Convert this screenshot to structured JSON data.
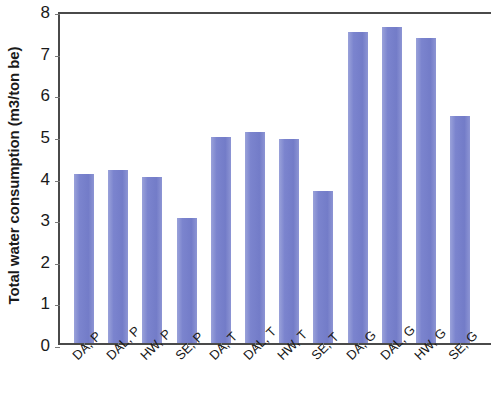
{
  "chart_data": {
    "type": "bar",
    "title": "",
    "subtitle": "",
    "xlabel": "",
    "ylabel": "Total water consumption (m3/ton be)",
    "ylim": [
      0,
      8
    ],
    "ytick_labels": [
      "8",
      "7",
      "6",
      "5",
      "4",
      "3",
      "2",
      "1",
      "0"
    ],
    "ytick_values": [
      8,
      7,
      6,
      5,
      4,
      3,
      2,
      1,
      0
    ],
    "grid": false,
    "legend": "none",
    "bar_color": "#7b84ce",
    "axis_color": "#4a4a4a",
    "categories": [
      "DA, P",
      "DAL, P",
      "HW, P",
      "SE, P",
      "DA, T",
      "DAL, T",
      "HW, T",
      "SE, T",
      "DA, G",
      "DAL, G",
      "HW, G",
      "SE, G"
    ],
    "values": [
      4.05,
      4.15,
      3.98,
      3.0,
      4.95,
      5.07,
      4.9,
      3.65,
      7.47,
      7.6,
      7.33,
      5.45
    ]
  }
}
